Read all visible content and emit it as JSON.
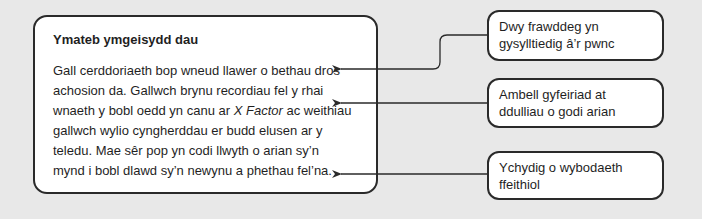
{
  "main_box": {
    "title": "Ymateb ymgeisydd dau",
    "body_part1": "Gall cerddoriaeth bop wneud llawer o bethau dros achosion da. Gallwch brynu recordiau fel y rhai wnaeth y bobl oedd yn canu ar ",
    "body_italic": "X Factor",
    "body_part2": " ac weithiau gallwch wylio cyngherddau er budd elusen ar y teledu. Mae sêr pop yn codi llwyth o arian sy’n mynd i bobl dlawd sy’n newynu a phethau fel’na."
  },
  "annotations": [
    {
      "label": "Dwy frawddeg yn gysylltiedig â’r pwnc",
      "points_to_line": 1
    },
    {
      "label": "Ambell gyfeiriad at ddulliau o godi arian",
      "points_to_line": 3
    },
    {
      "label": "Ychydig o wybodaeth ffeithiol",
      "points_to_line": 6
    }
  ],
  "colors": {
    "background": "#e8e8e8",
    "box_fill": "#ffffff",
    "border": "#2a2a2a",
    "text": "#1f1f1f"
  }
}
